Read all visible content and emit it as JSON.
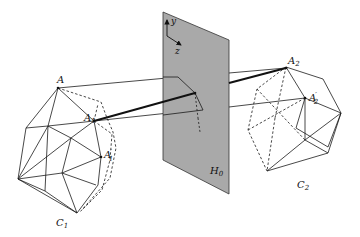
{
  "figure": {
    "type": "diagram",
    "colors": {
      "plane_fill": "#a9a9a9",
      "line": "#1a1a1a",
      "background": "#ffffff"
    }
  },
  "labels": {
    "point_A": "A",
    "point_A1": "A",
    "point_A1_sub": "1",
    "point_A1_prime": "A",
    "point_A1_prime_sub": "1",
    "point_A1_prime_mark": "′",
    "point_A2": "A",
    "point_A2_sub": "2",
    "point_A2_prime": "A",
    "point_A2_prime_sub": "2",
    "point_A2_prime_mark": "′",
    "camera_C1": "C",
    "camera_C1_sub": "1",
    "camera_C2": "C",
    "camera_C2_sub": "2",
    "plane_H0": "H",
    "plane_H0_sub": "0",
    "axis_y": "y",
    "axis_z": "z"
  }
}
